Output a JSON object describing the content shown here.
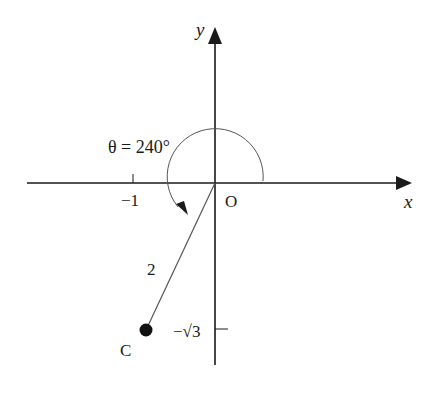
{
  "diagram": {
    "axes": {
      "x_label": "x",
      "y_label": "y",
      "origin_label": "O"
    },
    "ticks": {
      "x_tick_label": "−1",
      "y_tick_label": "−√3"
    },
    "angle": {
      "label": "θ = 240°",
      "degrees": 240
    },
    "segment": {
      "length_label": "2"
    },
    "point": {
      "label": "C",
      "coords": [
        "-1",
        "-√3"
      ]
    },
    "colors": {
      "ink": "#1a1a1a",
      "arc": "#555555",
      "background": "#ffffff"
    }
  }
}
